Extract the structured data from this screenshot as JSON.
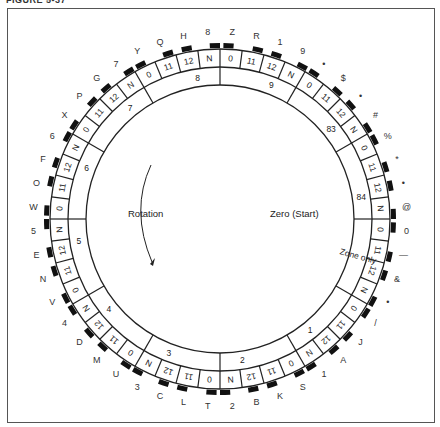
{
  "figure": {
    "caption": "FIGURE 5-37"
  },
  "wheel": {
    "center_labels": {
      "rotation": "Rotation",
      "zero_start": "Zero (Start)"
    },
    "cells": [
      {
        "code": "0",
        "char": "Z"
      },
      {
        "code": "11",
        "char": "R"
      },
      {
        "code": "12",
        "char": "1"
      },
      {
        "code": "N",
        "char": "9"
      },
      {
        "code": "0",
        "char": "•"
      },
      {
        "code": "11",
        "char": "$"
      },
      {
        "code": "12",
        "char": "•"
      },
      {
        "code": "N",
        "char": "#"
      },
      {
        "code": "0",
        "char": "%"
      },
      {
        "code": "11",
        "char": "*"
      },
      {
        "code": "12",
        "char": "•"
      },
      {
        "code": "N",
        "char": "@"
      },
      {
        "code": "0",
        "char": "0"
      },
      {
        "code": "11",
        "char": "—"
      },
      {
        "code": "12",
        "char": "&"
      },
      {
        "code": "N",
        "char": "•"
      },
      {
        "code": "0",
        "char": "/"
      },
      {
        "code": "11",
        "char": "J"
      },
      {
        "code": "12",
        "char": "A"
      },
      {
        "code": "N",
        "char": "1"
      },
      {
        "code": "0",
        "char": "S"
      },
      {
        "code": "11",
        "char": "K"
      },
      {
        "code": "12",
        "char": "B"
      },
      {
        "code": "N",
        "char": "2"
      },
      {
        "code": "0",
        "char": "T"
      },
      {
        "code": "11",
        "char": "L"
      },
      {
        "code": "12",
        "char": "C"
      },
      {
        "code": "N",
        "char": "3"
      },
      {
        "code": "0",
        "char": "U"
      },
      {
        "code": "11",
        "char": "M"
      },
      {
        "code": "12",
        "char": "D"
      },
      {
        "code": "N",
        "char": "4"
      },
      {
        "code": "0",
        "char": "V"
      },
      {
        "code": "11",
        "char": "N"
      },
      {
        "code": "12",
        "char": "E"
      },
      {
        "code": "N",
        "char": "5"
      },
      {
        "code": "0",
        "char": "W"
      },
      {
        "code": "11",
        "char": "O"
      },
      {
        "code": "12",
        "char": "F"
      },
      {
        "code": "N",
        "char": "6"
      },
      {
        "code": "0",
        "char": "X"
      },
      {
        "code": "11",
        "char": "P"
      },
      {
        "code": "12",
        "char": "G"
      },
      {
        "code": "N",
        "char": "7"
      },
      {
        "code": "0",
        "char": "Y"
      },
      {
        "code": "11",
        "char": "Q"
      },
      {
        "code": "12",
        "char": "H"
      },
      {
        "code": "N",
        "char": "8"
      }
    ],
    "zones": [
      {
        "label": "9"
      },
      {
        "label": "83"
      },
      {
        "label": "84"
      },
      {
        "label": "Zone only"
      },
      {
        "label": "1"
      },
      {
        "label": "2"
      },
      {
        "label": "3"
      },
      {
        "label": "4"
      },
      {
        "label": "5"
      },
      {
        "label": "6"
      },
      {
        "label": "7"
      },
      {
        "label": "8"
      }
    ]
  }
}
